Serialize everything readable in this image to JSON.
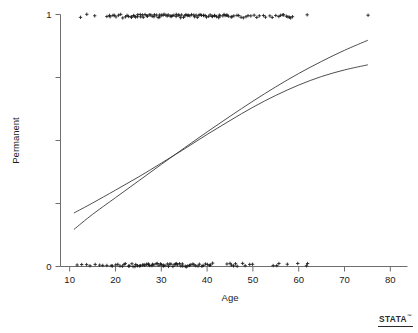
{
  "figure": {
    "title": "",
    "logo": {
      "text": "STATA",
      "trademark": "™"
    }
  },
  "chart_data": {
    "type": "scatter",
    "title": "",
    "subtitle": "",
    "xlabel": "Age",
    "ylabel": "Permanent",
    "xlim": [
      8,
      82
    ],
    "ylim": [
      0,
      1
    ],
    "xticks": [
      10,
      20,
      30,
      40,
      50,
      60,
      70,
      80
    ],
    "xticklabels": [
      "10",
      "20",
      "30",
      "40",
      "50",
      "60",
      "70",
      "80"
    ],
    "yticks": [
      0,
      0.25,
      0.5,
      0.75,
      1
    ],
    "yticklabels": [
      "0",
      "",
      "",
      "",
      "1"
    ],
    "grid": false,
    "legend": null,
    "marker": "plus",
    "marker_color": "#1a1a1a",
    "line_color": "#3a3a3a",
    "series": [
      {
        "name": "Permanent = 1 observations",
        "type": "scatter",
        "y_value": 1,
        "x": [
          12.3,
          13.6,
          15.4,
          18.1,
          18.6,
          19.0,
          19.4,
          19.8,
          20.2,
          20.6,
          21.3,
          21.7,
          22.1,
          22.5,
          22.9,
          23.3,
          23.6,
          23.9,
          24.2,
          24.5,
          24.8,
          25.0,
          25.3,
          25.6,
          25.9,
          26.2,
          26.5,
          26.8,
          27.1,
          27.4,
          27.7,
          28.0,
          28.3,
          28.6,
          28.9,
          29.2,
          29.5,
          29.8,
          30.1,
          30.4,
          30.7,
          31.0,
          31.3,
          31.6,
          31.9,
          32.2,
          32.5,
          32.8,
          33.1,
          33.4,
          33.7,
          34.0,
          34.3,
          34.6,
          34.9,
          35.2,
          35.5,
          35.8,
          36.1,
          36.4,
          36.7,
          37.0,
          37.3,
          37.6,
          37.9,
          38.2,
          38.5,
          38.8,
          39.1,
          39.4,
          39.7,
          40.0,
          40.3,
          40.6,
          40.9,
          41.2,
          41.5,
          41.8,
          42.1,
          42.4,
          42.7,
          43.0,
          43.3,
          43.6,
          43.9,
          44.2,
          44.5,
          44.8,
          45.1,
          45.5,
          46.0,
          46.4,
          46.9,
          47.4,
          47.9,
          48.4,
          49.0,
          49.6,
          50.2,
          50.8,
          51.5,
          52.2,
          52.9,
          53.6,
          54.3,
          55.0,
          55.5,
          56.0,
          56.4,
          56.8,
          57.2,
          57.6,
          58.0,
          58.4,
          58.8,
          62.0,
          75.0
        ],
        "n": 117
      },
      {
        "name": "Permanent = 0 observations",
        "type": "scatter",
        "y_value": 0,
        "x": [
          11.5,
          12.8,
          13.8,
          14.6,
          15.6,
          16.5,
          17.4,
          18.2,
          18.9,
          19.4,
          19.9,
          20.4,
          20.9,
          21.4,
          21.9,
          22.3,
          22.7,
          23.1,
          23.5,
          23.9,
          24.3,
          24.6,
          24.9,
          25.2,
          25.5,
          25.8,
          26.1,
          26.4,
          26.7,
          27.0,
          27.3,
          27.6,
          27.9,
          28.2,
          28.5,
          28.8,
          29.1,
          29.4,
          29.7,
          30.0,
          30.3,
          30.6,
          30.9,
          31.2,
          31.5,
          31.8,
          32.1,
          32.4,
          32.7,
          33.0,
          33.3,
          33.6,
          33.9,
          34.2,
          34.5,
          34.8,
          35.1,
          35.4,
          35.7,
          36.0,
          36.4,
          36.8,
          37.2,
          37.6,
          38.0,
          38.4,
          38.8,
          39.2,
          39.6,
          40.0,
          40.4,
          40.8,
          41.2,
          44.5,
          45.0,
          45.4,
          45.8,
          46.2,
          46.6,
          47.6,
          48.2,
          49.4,
          50.0,
          54.5,
          55.2,
          55.8,
          57.5,
          59.8,
          61.6,
          62.1
        ],
        "n": 90
      },
      {
        "name": "Logistic fit",
        "type": "line",
        "x": [
          11.0,
          15.0,
          20.0,
          25.0,
          30.0,
          35.0,
          40.0,
          45.0,
          50.0,
          55.0,
          60.0,
          65.0,
          70.0,
          75.0
        ],
        "y": [
          0.148,
          0.207,
          0.273,
          0.339,
          0.405,
          0.47,
          0.534,
          0.596,
          0.656,
          0.713,
          0.766,
          0.814,
          0.858,
          0.897
        ]
      },
      {
        "name": "Lowess smooth",
        "type": "line",
        "x": [
          11.0,
          15.0,
          20.0,
          25.0,
          30.0,
          35.0,
          40.0,
          45.0,
          50.0,
          55.0,
          60.0,
          65.0,
          70.0,
          75.0
        ],
        "y": [
          0.213,
          0.252,
          0.303,
          0.355,
          0.41,
          0.466,
          0.524,
          0.579,
          0.632,
          0.679,
          0.72,
          0.754,
          0.78,
          0.8
        ]
      }
    ]
  }
}
